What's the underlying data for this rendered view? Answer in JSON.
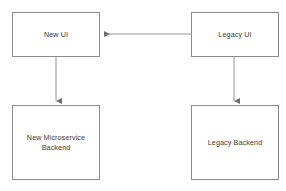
{
  "diagram": {
    "canvas": {
      "width": 286,
      "height": 191,
      "background": "#ffffff"
    },
    "style": {
      "node_border_color": "#8a8a8a",
      "node_fill_color": "#ffffff",
      "edge_color": "#8a8a8a",
      "text_color": "#3a3a3a"
    },
    "nodes": [
      {
        "id": "new-ui",
        "label": "New UI",
        "shape": "rectangle",
        "x": 12,
        "y": 12,
        "width": 88,
        "height": 45
      },
      {
        "id": "legacy-ui",
        "label": "Legacy UI",
        "shape": "rectangle",
        "x": 191,
        "y": 12,
        "width": 88,
        "height": 45
      },
      {
        "id": "new-microservice-backend",
        "label": "New Microservice\nBackend",
        "shape": "rectangle",
        "x": 12,
        "y": 105,
        "width": 88,
        "height": 75
      },
      {
        "id": "legacy-backend",
        "label": "Legacy Backend",
        "shape": "rectangle",
        "x": 191,
        "y": 105,
        "width": 88,
        "height": 75
      }
    ],
    "edges": [
      {
        "id": "legacy-ui-to-new-ui",
        "from": "legacy-ui",
        "to": "new-ui",
        "label": "",
        "direction": "left",
        "arrowhead": "end",
        "points": "191,34 101,34"
      },
      {
        "id": "new-ui-to-new-backend",
        "from": "new-ui",
        "to": "new-microservice-backend",
        "label": "",
        "direction": "down",
        "arrowhead": "end",
        "points": "56,57 56,104"
      },
      {
        "id": "legacy-ui-to-legacy-backend",
        "from": "legacy-ui",
        "to": "legacy-backend",
        "label": "",
        "direction": "down",
        "arrowhead": "end",
        "points": "234,57 234,104"
      }
    ]
  }
}
